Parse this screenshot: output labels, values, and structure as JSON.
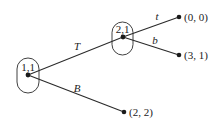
{
  "diagram": {
    "type": "extensive-form game tree",
    "decision_nodes": [
      {
        "id": "n1",
        "label": "1,1",
        "player": 1,
        "info_set": 1
      },
      {
        "id": "n2",
        "label": "2,1",
        "player": 2,
        "info_set": 1
      }
    ],
    "actions": [
      {
        "from": "n1",
        "to": "n2",
        "label": "T"
      },
      {
        "from": "n1",
        "to": "z3",
        "label": "B"
      },
      {
        "from": "n2",
        "to": "z1",
        "label": "t"
      },
      {
        "from": "n2",
        "to": "z2",
        "label": "b"
      }
    ],
    "terminals": [
      {
        "id": "z1",
        "payoff": "(0, 0)"
      },
      {
        "id": "z2",
        "payoff": "(3, 1)"
      },
      {
        "id": "z3",
        "payoff": "(2, 2)"
      }
    ]
  }
}
